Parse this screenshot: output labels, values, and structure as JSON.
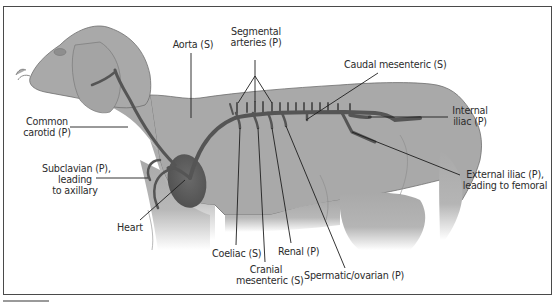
{
  "figure": {
    "colors": {
      "body_fill": "#a9a9a9",
      "body_outline": "#6e6e6e",
      "artery": "#555555",
      "heart": "#5e5e5e",
      "leader_line": "#1e1e1e",
      "frame": "#4a4a4a",
      "text": "#2c2c2c"
    }
  },
  "labels": {
    "aorta": "Aorta (S)",
    "segmental_line1": "Segmental",
    "segmental_line2": "arteries (P)",
    "caudal_mesenteric": "Caudal mesenteric (S)",
    "internal_iliac_line1": "Internal",
    "internal_iliac_line2": "iliac (P)",
    "common_carotid_line1": "Common",
    "common_carotid_line2": "carotid (P)",
    "subclavian_line1": "Subclavian (P),",
    "subclavian_line2": "leading",
    "subclavian_line3": "to axillary",
    "heart": "Heart",
    "external_iliac_line1": "External iliac (P),",
    "external_iliac_line2": "leading to femoral",
    "coeliac": "Coeliac (S)",
    "cranial_mesenteric_line1": "Cranial",
    "cranial_mesenteric_line2": "mesenteric (S)",
    "renal": "Renal (P)",
    "spermatic_ovarian": "Spermatic/ovarian (P)"
  }
}
